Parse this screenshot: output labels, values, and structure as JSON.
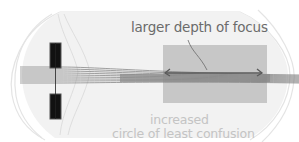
{
  "diagram": {
    "labels": {
      "depth_of_focus": "larger depth of focus",
      "circle_line1": "increased",
      "circle_line2": "circle of least confusion"
    },
    "elements": {
      "aperture": "pupil aperture (black blocks)",
      "rays": "parallel light rays converging",
      "focus_zone": "shaded depth of focus region",
      "arrow": "double-headed arrow across focus zone"
    },
    "colors": {
      "aperture": "#111111",
      "rays": "#7a7a7a",
      "focus_zone": "#bdbdbd",
      "eye_outline": "#e2e2e2",
      "label_dark": "#6b6b6b",
      "label_light": "#c4c4c4"
    }
  }
}
